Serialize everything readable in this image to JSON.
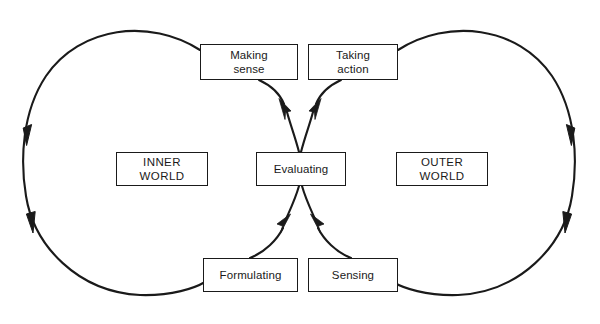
{
  "diagram": {
    "type": "cycle-diagram",
    "background_color": "#ffffff",
    "line_color": "#1a1a1a",
    "text_color": "#1a1a1a",
    "width": 600,
    "height": 324
  },
  "nodes": {
    "making_sense": {
      "label": "Making\nsense",
      "x": 200,
      "y": 44,
      "w": 98,
      "h": 36
    },
    "taking_action": {
      "label": "Taking\naction",
      "x": 308,
      "y": 44,
      "w": 90,
      "h": 36
    },
    "inner_world": {
      "label": "INNER\nWORLD",
      "x": 116,
      "y": 152,
      "w": 92,
      "h": 34
    },
    "evaluating": {
      "label": "Evaluating",
      "x": 256,
      "y": 152,
      "w": 90,
      "h": 34
    },
    "outer_world": {
      "label": "OUTER\nWORLD",
      "x": 396,
      "y": 152,
      "w": 92,
      "h": 34
    },
    "formulating": {
      "label": "Formulating",
      "x": 203,
      "y": 258,
      "w": 95,
      "h": 34
    },
    "sensing": {
      "label": "Sensing",
      "x": 308,
      "y": 258,
      "w": 90,
      "h": 34
    }
  },
  "connectors": [
    {
      "name": "evaluating-to-making-sense",
      "from": "evaluating",
      "to": "making_sense",
      "arrowhead": "at-making-sense-end",
      "direction": "up-left"
    },
    {
      "name": "evaluating-to-taking-action",
      "from": "evaluating",
      "to": "taking_action",
      "arrowhead": "at-taking-action-end",
      "direction": "up-right"
    },
    {
      "name": "formulating-to-evaluating",
      "from": "formulating",
      "to": "evaluating",
      "arrowhead": "at-evaluating-end",
      "direction": "up-right"
    },
    {
      "name": "sensing-to-evaluating",
      "from": "sensing",
      "to": "evaluating",
      "arrowhead": "at-evaluating-end",
      "direction": "up-left"
    },
    {
      "name": "inner-world-loop",
      "from": "making_sense",
      "to": "formulating",
      "side": "left",
      "flow": "counterclockwise",
      "arrowheads": 2
    },
    {
      "name": "outer-world-loop",
      "from": "taking_action",
      "to": "sensing",
      "side": "right",
      "flow": "clockwise",
      "arrowheads": 2
    }
  ]
}
